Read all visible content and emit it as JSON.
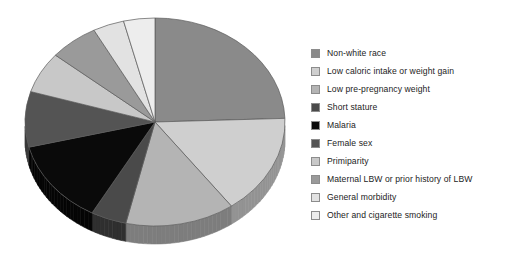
{
  "chart_data": {
    "type": "pie",
    "title": "",
    "subtitle": "",
    "xlabel": "",
    "ylabel": "",
    "legend_position": "right",
    "grid": false,
    "three_d": true,
    "start_angle_deg": 0,
    "direction": "clockwise",
    "units": "percent",
    "categories": [
      "Non-white race",
      "Low caloric intake or weight gain",
      "Low pre-pregnancy weight",
      "Short stature",
      "Malaria",
      "Female sex",
      "Primiparity",
      "Maternal LBW or prior history of LBW",
      "General morbidity",
      "Other and cigarette smoking"
    ],
    "values": [
      24.5,
      15.5,
      13.5,
      4.5,
      13.0,
      8.5,
      6.5,
      6.0,
      4.0,
      4.0
    ],
    "colors": [
      "#8a8a8a",
      "#cfcfcf",
      "#b4b4b4",
      "#4a4a4a",
      "#0a0a0a",
      "#545454",
      "#c8c8c8",
      "#9a9a9a",
      "#e2e2e2",
      "#ededed"
    ],
    "side_colors": [
      "#5e5e5e",
      "#939393",
      "#7d7d7d",
      "#2f2f2f",
      "#050505",
      "#383838",
      "#8d8d8d",
      "#6b6b6b",
      "#a2a2a2",
      "#a9a9a9"
    ],
    "slice_angles_deg": [
      {
        "label": "Non-white race",
        "start": 0,
        "end": 88
      },
      {
        "label": "Low caloric intake or weight gain",
        "start": 88,
        "end": 144
      },
      {
        "label": "Low pre-pregnancy weight",
        "start": 144,
        "end": 193
      },
      {
        "label": "Short stature",
        "start": 193,
        "end": 209
      },
      {
        "label": "Malaria",
        "start": 209,
        "end": 256
      },
      {
        "label": "Female sex",
        "start": 256,
        "end": 287
      },
      {
        "label": "Primiparity",
        "start": 287,
        "end": 310
      },
      {
        "label": "Maternal LBW or prior history of LBW",
        "start": 310,
        "end": 332
      },
      {
        "label": "General morbidity",
        "start": 332,
        "end": 346
      },
      {
        "label": "Other and cigarette smoking",
        "start": 346,
        "end": 360
      }
    ]
  },
  "legend": {
    "items": [
      {
        "label": "Non-white race",
        "color": "#8a8a8a"
      },
      {
        "label": "Low caloric intake or weight gain",
        "color": "#cfcfcf"
      },
      {
        "label": "Low pre-pregnancy weight",
        "color": "#b4b4b4"
      },
      {
        "label": "Short stature",
        "color": "#4a4a4a"
      },
      {
        "label": "Malaria",
        "color": "#0a0a0a"
      },
      {
        "label": "Female sex",
        "color": "#545454"
      },
      {
        "label": "Primiparity",
        "color": "#c8c8c8"
      },
      {
        "label": "Maternal LBW or prior history of LBW",
        "color": "#9a9a9a"
      },
      {
        "label": "General morbidity",
        "color": "#e2e2e2"
      },
      {
        "label": "Other and cigarette smoking",
        "color": "#ededed"
      }
    ]
  },
  "geometry": {
    "center_x": 155,
    "center_y": 122,
    "radius_x": 130,
    "radius_y": 104,
    "depth": 18
  }
}
